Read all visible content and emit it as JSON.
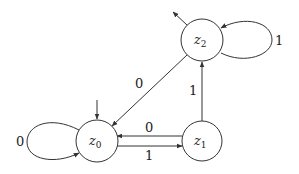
{
  "diagram": {
    "type": "finite-state-automaton",
    "states": [
      {
        "id": "z0",
        "name": "z",
        "sub": "0",
        "cx": 97,
        "cy": 141,
        "r": 21,
        "initial": true,
        "final": false
      },
      {
        "id": "z1",
        "name": "z",
        "sub": "1",
        "cx": 202,
        "cy": 141,
        "r": 20,
        "initial": false,
        "final": false
      },
      {
        "id": "z2",
        "name": "z",
        "sub": "2",
        "cx": 202,
        "cy": 40,
        "r": 21,
        "initial": false,
        "final": true
      }
    ],
    "transitions": [
      {
        "from": "z0",
        "to": "z0",
        "label": "0"
      },
      {
        "from": "z0",
        "to": "z1",
        "label": "1"
      },
      {
        "from": "z1",
        "to": "z0",
        "label": "0"
      },
      {
        "from": "z1",
        "to": "z2",
        "label": "1"
      },
      {
        "from": "z2",
        "to": "z0",
        "label": "0"
      },
      {
        "from": "z2",
        "to": "z2",
        "label": "1"
      }
    ],
    "edge_color": "#333333"
  }
}
